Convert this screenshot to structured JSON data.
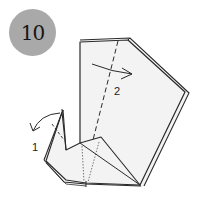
{
  "step": {
    "number": "10"
  },
  "annotations": [
    {
      "id": "fold-1",
      "label": "1",
      "description": "curved arrow folding head tip outward/left"
    },
    {
      "id": "fold-2",
      "label": "2",
      "description": "curved arrow folding along dashed valley line to the right"
    }
  ],
  "colors": {
    "badge": "#a9a9a9",
    "paper": "#f2f2f2",
    "line": "#2a2a2a"
  }
}
